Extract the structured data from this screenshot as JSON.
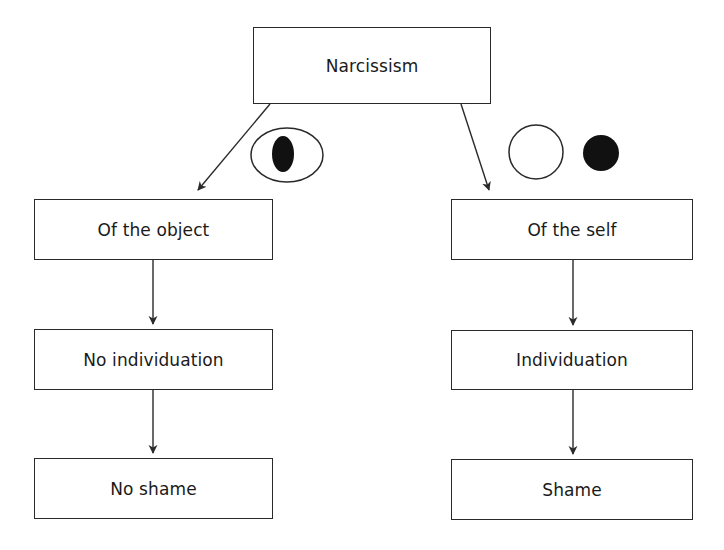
{
  "diagram": {
    "type": "flowchart",
    "root": {
      "id": "narcissism",
      "label": "Narcissism"
    },
    "branches": [
      {
        "id": "left",
        "symbol": "eye-with-pupil",
        "nodes": [
          {
            "id": "of-the-object",
            "label": "Of the object"
          },
          {
            "id": "no-individuation",
            "label": "No individuation"
          },
          {
            "id": "no-shame",
            "label": "No shame"
          }
        ]
      },
      {
        "id": "right",
        "symbol": "open-circle-and-filled-circle",
        "nodes": [
          {
            "id": "of-the-self",
            "label": "Of the self"
          },
          {
            "id": "individuation",
            "label": "Individuation"
          },
          {
            "id": "shame",
            "label": "Shame"
          }
        ]
      }
    ],
    "edges": [
      [
        "Narcissism",
        "Of the object"
      ],
      [
        "Of the object",
        "No individuation"
      ],
      [
        "No individuation",
        "No shame"
      ],
      [
        "Narcissism",
        "Of the self"
      ],
      [
        "Of the self",
        "Individuation"
      ],
      [
        "Individuation",
        "Shame"
      ]
    ],
    "colors": {
      "line": "#2a2a2a",
      "fill": "#111111",
      "background": "#ffffff"
    }
  }
}
